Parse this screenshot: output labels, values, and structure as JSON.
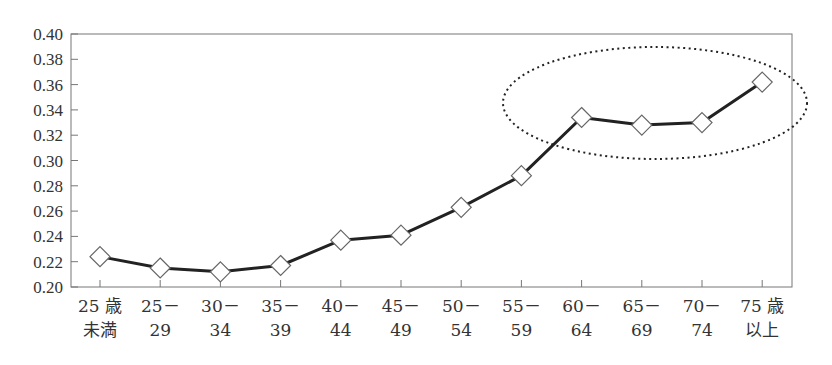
{
  "chart_data": {
    "type": "line",
    "title": "",
    "xlabel": "",
    "ylabel": "",
    "categories": [
      [
        "25 歳",
        "未満"
      ],
      [
        "25－",
        "29"
      ],
      [
        "30－",
        "34"
      ],
      [
        "35－",
        "39"
      ],
      [
        "40－",
        "44"
      ],
      [
        "45－",
        "49"
      ],
      [
        "50－",
        "54"
      ],
      [
        "55－",
        "59"
      ],
      [
        "60－",
        "64"
      ],
      [
        "65－",
        "69"
      ],
      [
        "70－",
        "74"
      ],
      [
        "75 歳",
        "以上"
      ]
    ],
    "series": [
      {
        "name": "",
        "marker": "diamond-open",
        "color": "#222222",
        "values": [
          0.224,
          0.215,
          0.212,
          0.217,
          0.237,
          0.241,
          0.263,
          0.288,
          0.334,
          0.328,
          0.33,
          0.362
        ]
      }
    ],
    "ylim": [
      0.2,
      0.4
    ],
    "yticks": [
      "0.20",
      "0.22",
      "0.24",
      "0.26",
      "0.28",
      "0.30",
      "0.32",
      "0.34",
      "0.36",
      "0.38",
      "0.40"
    ],
    "grid": false,
    "legend": "none",
    "annotations": [
      {
        "type": "dotted-ellipse",
        "encloses_categories": [
          "60－64",
          "65－69",
          "70－74",
          "75 歳以上"
        ]
      }
    ]
  }
}
